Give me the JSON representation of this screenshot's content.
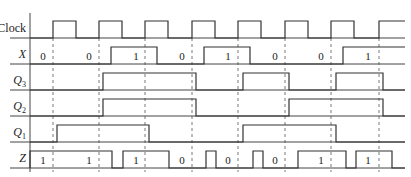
{
  "diagram": {
    "axis_x": 30,
    "x_end": 405,
    "high_offset": 17,
    "clock_edges": [
      53,
      99,
      145,
      192,
      238,
      285,
      331,
      379
    ],
    "signals": [
      {
        "id": "clock",
        "label": "Clock",
        "sub": "",
        "italic": false,
        "baseline": 38,
        "pulses": [
          [
            53,
            76
          ],
          [
            99,
            122
          ],
          [
            145,
            168
          ],
          [
            192,
            215
          ],
          [
            238,
            261
          ],
          [
            285,
            308
          ],
          [
            331,
            354
          ],
          [
            379,
            405
          ]
        ],
        "values": []
      },
      {
        "id": "x",
        "label": "X",
        "sub": "",
        "italic": true,
        "baseline": 64,
        "pulses": [
          [
            111,
            157
          ],
          [
            204,
            250
          ],
          [
            343,
            405
          ]
        ],
        "values": [
          {
            "x": 47,
            "text": "0"
          },
          {
            "x": 93,
            "text": "0"
          },
          {
            "x": 140,
            "text": "1"
          },
          {
            "x": 186,
            "text": "0"
          },
          {
            "x": 232,
            "text": "1"
          },
          {
            "x": 279,
            "text": "0"
          },
          {
            "x": 325,
            "text": "0"
          },
          {
            "x": 372,
            "text": "1"
          }
        ]
      },
      {
        "id": "q3",
        "label": "Q",
        "sub": "3",
        "italic": true,
        "baseline": 90,
        "pulses": [
          [
            103,
            196
          ],
          [
            243,
            289
          ],
          [
            336,
            383
          ]
        ],
        "values": []
      },
      {
        "id": "q2",
        "label": "Q",
        "sub": "2",
        "italic": true,
        "baseline": 116,
        "pulses": [
          [
            103,
            196
          ],
          [
            289,
            383
          ]
        ],
        "values": []
      },
      {
        "id": "q1",
        "label": "Q",
        "sub": "1",
        "italic": true,
        "baseline": 142,
        "pulses": [
          [
            57,
            149
          ],
          [
            243,
            336
          ]
        ],
        "values": []
      },
      {
        "id": "z",
        "label": "Z",
        "sub": "",
        "italic": true,
        "baseline": 168,
        "pulses": [
          [
            30,
            112
          ],
          [
            123,
            169
          ],
          [
            206,
            216
          ],
          [
            253,
            263
          ],
          [
            298,
            346
          ],
          [
            356,
            392
          ]
        ],
        "values": [
          {
            "x": 47,
            "text": "1"
          },
          {
            "x": 93,
            "text": "1"
          },
          {
            "x": 140,
            "text": "1"
          },
          {
            "x": 186,
            "text": "0"
          },
          {
            "x": 232,
            "text": "0"
          },
          {
            "x": 279,
            "text": "0"
          },
          {
            "x": 325,
            "text": "1"
          },
          {
            "x": 372,
            "text": "1"
          }
        ]
      }
    ]
  }
}
